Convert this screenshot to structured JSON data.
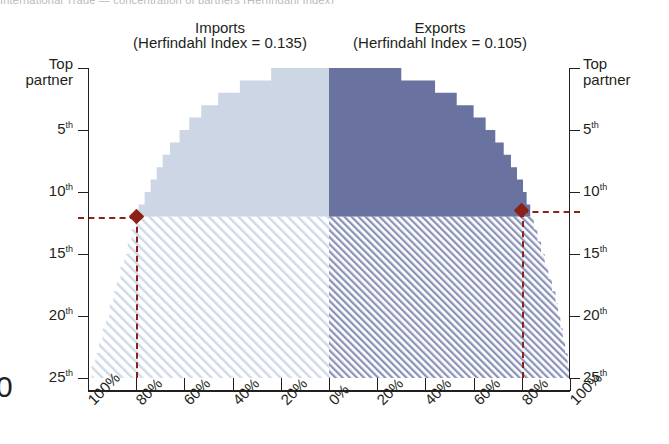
{
  "figure": {
    "top_cut_text": "International Trade — concentration of partners (Herfindahl Index)",
    "left_edge_glyph": "0"
  },
  "panels": [
    {
      "id": "imports",
      "title": "Imports",
      "subtitle": "(Herfindahl Index = 0.135)",
      "herfindahl_index": 0.135,
      "fill_color": "#ccd6e4",
      "hatch_color": "#b9c6da"
    },
    {
      "id": "exports",
      "title": "Exports",
      "subtitle": "(Herfindahl Index = 0.105)",
      "herfindahl_index": 0.105,
      "fill_color": "#6a72a0",
      "hatch_color": "#7c85ad"
    }
  ],
  "axes": {
    "y_label_top": "Top\npartner",
    "y_ticks": [
      {
        "label": "Top partner",
        "line1": "Top",
        "line2": "partner",
        "rank": 1,
        "two_line": true
      },
      {
        "label": "5th",
        "num": "5",
        "sup": "th",
        "rank": 5,
        "two_line": false
      },
      {
        "label": "10th",
        "num": "10",
        "sup": "th",
        "rank": 10,
        "two_line": false
      },
      {
        "label": "15th",
        "num": "15",
        "sup": "th",
        "rank": 15,
        "two_line": false
      },
      {
        "label": "20th",
        "num": "20",
        "sup": "th",
        "rank": 20,
        "two_line": false
      },
      {
        "label": "25th",
        "num": "25",
        "sup": "th",
        "rank": 25,
        "two_line": false
      }
    ],
    "x_ticks": [
      "100%",
      "80%",
      "60%",
      "40%",
      "20%",
      "0%",
      "20%",
      "40%",
      "60%",
      "80%",
      "100%"
    ],
    "x_values": [
      -100,
      -80,
      -60,
      -40,
      -20,
      0,
      20,
      40,
      60,
      80,
      100
    ]
  },
  "markers": {
    "color": "#8c2118",
    "imports": {
      "rank": 12,
      "share_pct": 80,
      "note": "80% of imports covered by top 12 partners"
    },
    "exports": {
      "rank": 11.5,
      "share_pct": 80,
      "note": "80% of exports covered by top ~11 partners"
    }
  },
  "chart_data": {
    "type": "bar",
    "xlabel": "",
    "ylabel": "Partner rank",
    "xlim": [
      -100,
      100
    ],
    "ylim": [
      1,
      25
    ],
    "grid": false,
    "legend": "none",
    "orientation": "horizontal-mirrored",
    "categories": [
      1,
      2,
      3,
      4,
      5,
      6,
      7,
      8,
      9,
      10,
      11,
      12,
      13,
      14,
      15,
      16,
      17,
      18,
      19,
      20,
      21,
      22,
      23,
      24,
      25
    ],
    "series": [
      {
        "name": "Imports",
        "side": "left",
        "units": "cumulative % of imports",
        "values": [
          24,
          37,
          46,
          53,
          58,
          62,
          66,
          69,
          71.5,
          74,
          76.5,
          79,
          80.5,
          82,
          83.5,
          85,
          86.5,
          88,
          89.5,
          91,
          92.5,
          94,
          95.5,
          97,
          98.5
        ]
      },
      {
        "name": "Exports",
        "side": "right",
        "units": "cumulative % of exports",
        "values": [
          30,
          44,
          53,
          60,
          65,
          69,
          72.5,
          75.5,
          78,
          80.5,
          82,
          83.5,
          85,
          86.5,
          88,
          89.5,
          91,
          92.5,
          94,
          95,
          96,
          97,
          98,
          99,
          100
        ]
      }
    ],
    "annotations": [
      {
        "text": "Imports: 80% threshold at 12th partner",
        "x": -80,
        "y": 12
      },
      {
        "text": "Exports: 80% threshold at ~11th partner",
        "x": 80,
        "y": 11.5
      }
    ]
  }
}
